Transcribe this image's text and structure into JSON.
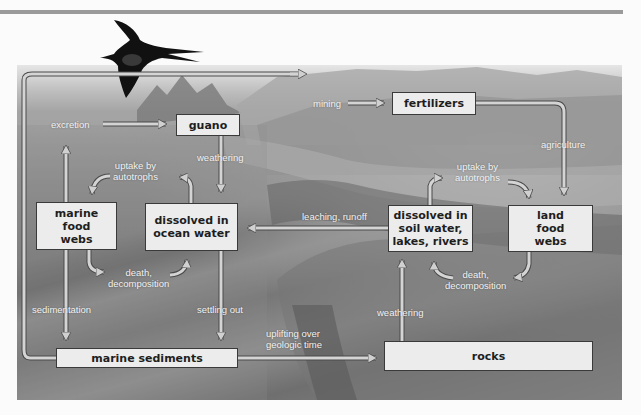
{
  "diagram": {
    "colors": {
      "box_fill": "#ececec",
      "box_border": "#3a3a3a",
      "arrow_fill": "#d0d0d0",
      "arrow_outline": "#4a4a4a",
      "label_text": "#f2f2f2"
    },
    "nodes": {
      "guano": "guano",
      "fertilizers": "fertilizers",
      "marine_food_webs": "marine food webs",
      "dissolved_ocean": "dissolved in ocean water",
      "dissolved_soil": "dissolved in soil water, lakes, rivers",
      "land_food_webs": "land food webs",
      "marine_sediments": "marine sediments",
      "rocks": "rocks"
    },
    "node_lines": {
      "marine_food_webs": [
        "marine",
        "food",
        "webs"
      ],
      "dissolved_ocean": [
        "dissolved in",
        "ocean water"
      ],
      "dissolved_soil": [
        "dissolved in",
        "soil water,",
        "lakes, rivers"
      ],
      "land_food_webs": [
        "land",
        "food",
        "webs"
      ]
    },
    "labels": {
      "mining": "mining",
      "excretion": "excretion",
      "weathering_guano": "weathering",
      "agriculture": "agriculture",
      "uptake_marine": [
        "uptake by",
        "autotrophs"
      ],
      "uptake_land": [
        "uptake by",
        "autotrophs"
      ],
      "leaching": "leaching, runoff",
      "death_marine": [
        "death,",
        "decomposition"
      ],
      "death_land": [
        "death,",
        "decomposition"
      ],
      "sedimentation": "sedimentation",
      "settling_out": "settling out",
      "uplifting": [
        "uplifting over",
        "geologic time"
      ],
      "weathering_rocks": "weathering"
    },
    "edges": [
      {
        "from": "marine sediments",
        "to": "mining",
        "label": "mining"
      },
      {
        "from": "mining",
        "to": "fertilizers",
        "label": ""
      },
      {
        "from": "marine food webs",
        "to": "guano",
        "label": "excretion"
      },
      {
        "from": "guano",
        "to": "dissolved in ocean water",
        "label": "weathering"
      },
      {
        "from": "fertilizers",
        "to": "land food webs",
        "label": "agriculture"
      },
      {
        "from": "dissolved in ocean water",
        "to": "marine food webs",
        "label": "uptake by autotrophs"
      },
      {
        "from": "marine food webs",
        "to": "dissolved in ocean water",
        "label": "death, decomposition"
      },
      {
        "from": "dissolved in soil water, lakes, rivers",
        "to": "land food webs",
        "label": "uptake by autotrophs"
      },
      {
        "from": "land food webs",
        "to": "dissolved in soil water, lakes, rivers",
        "label": "death, decomposition"
      },
      {
        "from": "dissolved in soil water, lakes, rivers",
        "to": "dissolved in ocean water",
        "label": "leaching, runoff"
      },
      {
        "from": "marine food webs",
        "to": "marine sediments",
        "label": "sedimentation"
      },
      {
        "from": "dissolved in ocean water",
        "to": "marine sediments",
        "label": "settling out"
      },
      {
        "from": "marine sediments",
        "to": "rocks",
        "label": "uplifting over geologic time"
      },
      {
        "from": "rocks",
        "to": "dissolved in soil water, lakes, rivers",
        "label": "weathering"
      }
    ]
  }
}
